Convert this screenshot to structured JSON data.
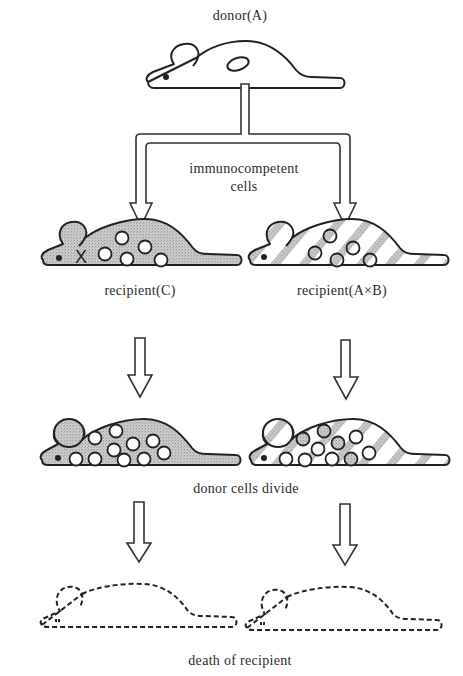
{
  "diagram": {
    "type": "flow-illustration",
    "labels": {
      "donor": "donor(A)",
      "transfer": "immunocompetent",
      "transfer_line2": "cells",
      "recipient_left": "recipient(C)",
      "recipient_right": "recipient(A×B)",
      "stage2": "donor cells divide",
      "stage3": "death of recipient"
    },
    "nodes": [
      {
        "id": "donor",
        "label": "donor(A)",
        "style": "white-outline mouse with spleen"
      },
      {
        "id": "recipient-c",
        "label": "recipient(C)",
        "style": "gray stippled mouse, X mark, 6 donor cells"
      },
      {
        "id": "recipient-axb",
        "label": "recipient(A×B)",
        "style": "diagonal-striped mouse, 6 donor cells"
      },
      {
        "id": "recipient-c-divide",
        "label": "donor cells divide",
        "style": "gray mouse, 12 white donor cells"
      },
      {
        "id": "recipient-axb-divide",
        "label": "donor cells divide",
        "style": "striped mouse, 12 mixed donor cells"
      },
      {
        "id": "dead-left",
        "label": "death of recipient",
        "style": "dashed outline mouse"
      },
      {
        "id": "dead-right",
        "label": "death of recipient",
        "style": "dashed outline mouse"
      }
    ],
    "edges": [
      {
        "from": "donor",
        "to": "recipient-c",
        "label": "immunocompetent cells"
      },
      {
        "from": "donor",
        "to": "recipient-axb",
        "label": "immunocompetent cells"
      },
      {
        "from": "recipient-c",
        "to": "recipient-c-divide"
      },
      {
        "from": "recipient-axb",
        "to": "recipient-axb-divide"
      },
      {
        "from": "recipient-c-divide",
        "to": "dead-left"
      },
      {
        "from": "recipient-axb-divide",
        "to": "dead-right"
      }
    ],
    "colors": {
      "outline": "#222222",
      "gray_fill": "#c4c4c4",
      "stripe_fill": "#cfcfcf",
      "background": "#ffffff"
    }
  }
}
